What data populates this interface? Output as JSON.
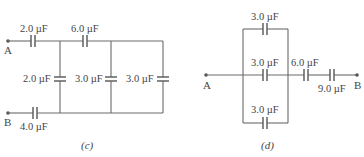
{
  "figure_c": {
    "caption": "(c)",
    "node_a": "A",
    "node_b": "B",
    "capacitors": {
      "top_left": "2.0 µF",
      "top_mid": "6.0 µF",
      "vert_1": "2.0 µF",
      "vert_2": "3.0 µF",
      "vert_3": "3.0 µF",
      "bottom_left": "4.0 µF"
    }
  },
  "figure_d": {
    "caption": "(d)",
    "node_a": "A",
    "node_b": "B",
    "capacitors": {
      "parallel_top": "3.0 µF",
      "parallel_mid": "3.0 µF",
      "parallel_bottom": "3.0 µF",
      "series_1": "6.0 µF",
      "series_2": "9.0 µF"
    }
  },
  "colors": {
    "wire": "#6a6a6a",
    "text": "#444444",
    "background": "#ffffff"
  }
}
